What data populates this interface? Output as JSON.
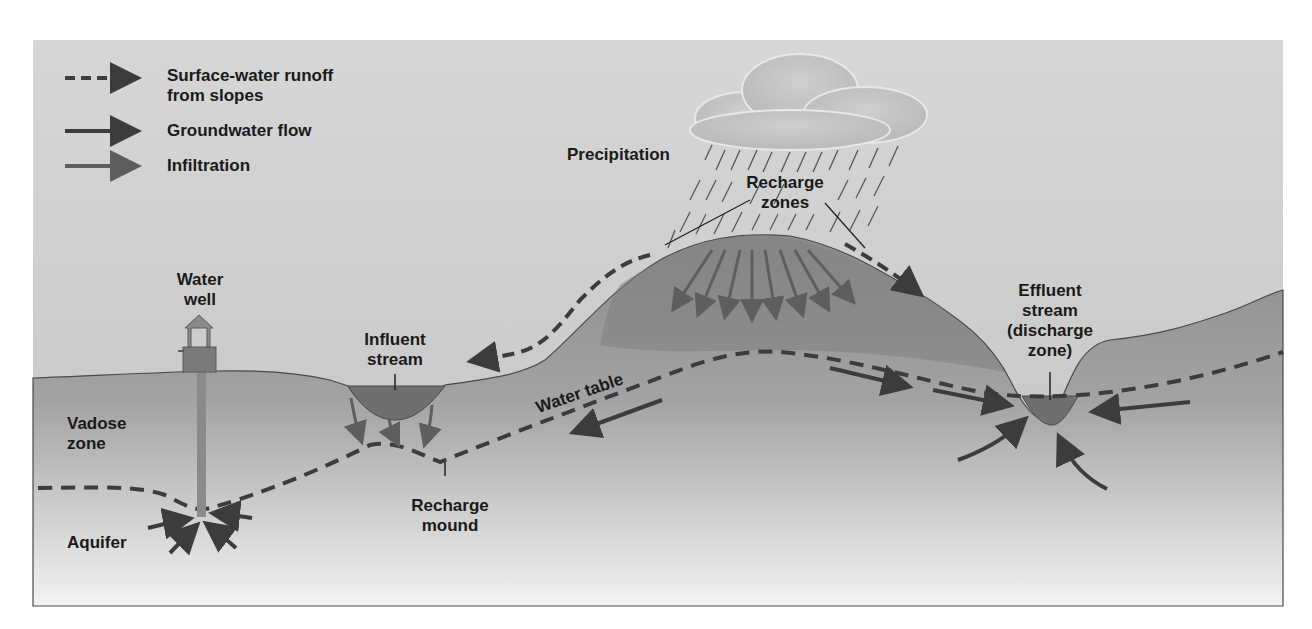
{
  "figure": {
    "type": "cross-section diagram"
  },
  "legend": {
    "items": [
      {
        "symbol": "dashed-arrow",
        "label_line1": "Surface-water runoff",
        "label_line2": "from slopes"
      },
      {
        "symbol": "solid-dark-arrow",
        "label_line1": "Groundwater flow",
        "label_line2": ""
      },
      {
        "symbol": "solid-gray-arrow",
        "label_line1": "Infiltration",
        "label_line2": ""
      }
    ]
  },
  "labels": {
    "precipitation": "Precipitation",
    "recharge_zones_1": "Recharge",
    "recharge_zones_2": "zones",
    "water_well_1": "Water",
    "water_well_2": "well",
    "influent_stream_1": "Influent",
    "influent_stream_2": "stream",
    "effluent_1": "Effluent",
    "effluent_2": "stream",
    "effluent_3": "(discharge",
    "effluent_4": "zone)",
    "vadose_1": "Vadose",
    "vadose_2": "zone",
    "water_table": "Water table",
    "recharge_mound_1": "Recharge",
    "recharge_mound_2": "mound",
    "aquifer": "Aquifer"
  },
  "colors": {
    "sky_top": "#c9c9c9",
    "ground": "#8f8f8f",
    "hill": "#7d7d7d",
    "deep_fade": "#f2f2f2",
    "water": "#6f6f6f",
    "arrow_dark": "#3c3c3c",
    "arrow_gray": "#5e5e5e",
    "text": "#1a1a1a"
  }
}
